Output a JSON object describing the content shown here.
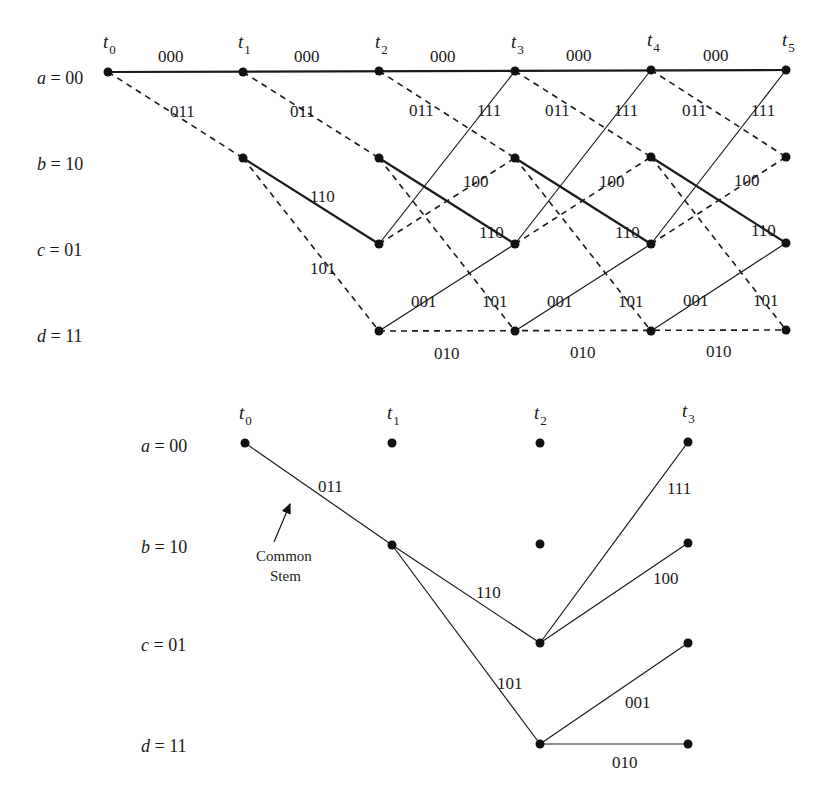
{
  "trellis": {
    "title": "Trellis diagram",
    "time_labels": [
      {
        "base": "t",
        "sub": "0"
      },
      {
        "base": "t",
        "sub": "1"
      },
      {
        "base": "t",
        "sub": "2"
      },
      {
        "base": "t",
        "sub": "3"
      },
      {
        "base": "t",
        "sub": "4"
      },
      {
        "base": "t",
        "sub": "5"
      }
    ],
    "states": [
      {
        "var": "a",
        "eq": " = 00"
      },
      {
        "var": "b",
        "eq": " = 10"
      },
      {
        "var": "c",
        "eq": " = 01"
      },
      {
        "var": "d",
        "eq": " = 11"
      }
    ],
    "branch_labels": {
      "aa": "000",
      "ab": "011",
      "bc": "110",
      "bd": "101",
      "ca": "111",
      "cb": "100",
      "dc": "001",
      "dd": "010"
    },
    "legend": {
      "solid": "input bit 0",
      "dashed": "input bit 1"
    }
  },
  "survivors": {
    "title": "Surviving paths",
    "time_labels": [
      {
        "base": "t",
        "sub": "0"
      },
      {
        "base": "t",
        "sub": "1"
      },
      {
        "base": "t",
        "sub": "2"
      },
      {
        "base": "t",
        "sub": "3"
      }
    ],
    "states": [
      {
        "var": "a",
        "eq": " = 00"
      },
      {
        "var": "b",
        "eq": " = 10"
      },
      {
        "var": "c",
        "eq": " = 01"
      },
      {
        "var": "d",
        "eq": " = 11"
      }
    ],
    "branch_labels": {
      "stem": "011",
      "bc": "110",
      "bd": "101",
      "ca": "111",
      "cb": "100",
      "dc": "001",
      "dd": "010"
    },
    "annotation": {
      "line1": "Common",
      "line2": "Stem"
    }
  }
}
